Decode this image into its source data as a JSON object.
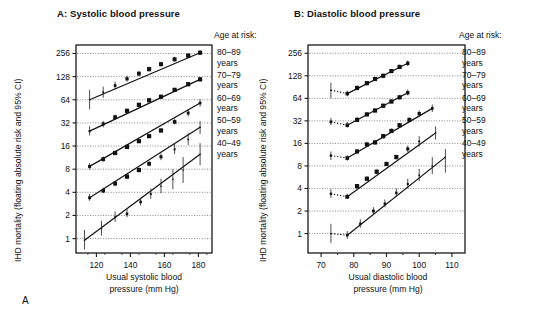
{
  "figure": {
    "letter": "A"
  },
  "panels": [
    {
      "id": "panel-a",
      "title": "A: Systolic blood pressure",
      "age_header": "Age at risk:",
      "ylabel": "IHD mortality (floating absolute risk and 95% CI)",
      "xlabel_line1": "Usual systolic blood",
      "xlabel_line2": "pressure (mm Hg)",
      "age_groups": [
        {
          "range": "80–89",
          "unit": "years"
        },
        {
          "range": "70–79",
          "unit": "years"
        },
        {
          "range": "60–69",
          "unit": "years"
        },
        {
          "range": "50–59",
          "unit": "years"
        },
        {
          "range": "40–49",
          "unit": "years"
        }
      ]
    },
    {
      "id": "panel-b",
      "title": "B: Diastolic blood pressure",
      "age_header": "Age at risk:",
      "ylabel": "IHD mortality (floating absolute risk and 95% CI)",
      "xlabel_line1": "Usual diastolic blood",
      "xlabel_line2": "pressure (mm Hg)",
      "age_groups": [
        {
          "range": "80–89",
          "unit": "years"
        },
        {
          "range": "70–79",
          "unit": "years"
        },
        {
          "range": "60–69",
          "unit": "years"
        },
        {
          "range": "50–59",
          "unit": "years"
        },
        {
          "range": "40–49",
          "unit": "years"
        }
      ]
    }
  ],
  "chart_data": [
    {
      "type": "scatter",
      "panel": "A",
      "title": "A: Systolic blood pressure",
      "xlabel": "Usual systolic blood pressure (mm Hg)",
      "ylabel": "IHD mortality (floating absolute risk and 95% CI)",
      "yscale": "log2",
      "xlim": [
        108,
        188
      ],
      "ylim": [
        0.65,
        330
      ],
      "xticks": [
        120,
        140,
        160,
        180
      ],
      "yticks": [
        1,
        2,
        4,
        8,
        16,
        32,
        64,
        128,
        256
      ],
      "grid": "horizontal-dotted",
      "legend_position": "right",
      "series": [
        {
          "name": "80–89 years",
          "x": [
            116,
            124,
            131,
            138,
            145,
            151,
            158,
            166,
            174,
            181
          ],
          "y": [
            64,
            80,
            98,
            120,
            140,
            160,
            186,
            215,
            240,
            262
          ],
          "ci_low": [
            48,
            68,
            88,
            110,
            130,
            150,
            172,
            200,
            224,
            244
          ],
          "ci_high": [
            86,
            95,
            110,
            132,
            152,
            172,
            200,
            232,
            258,
            282
          ]
        },
        {
          "name": "70–79 years",
          "x": [
            116,
            124,
            131,
            138,
            145,
            151,
            158,
            166,
            174,
            181
          ],
          "y": [
            25,
            31,
            38,
            46,
            55,
            63,
            70,
            86,
            102,
            118
          ],
          "ci_low": [
            22,
            28,
            35,
            43,
            52,
            60,
            66,
            81,
            96,
            110
          ],
          "ci_high": [
            29,
            34,
            41,
            49,
            58,
            67,
            75,
            92,
            109,
            127
          ]
        },
        {
          "name": "60–69 years",
          "x": [
            116,
            124,
            131,
            138,
            145,
            151,
            158,
            166,
            174,
            181
          ],
          "y": [
            8.7,
            10.8,
            13.0,
            15.6,
            18.5,
            21.5,
            25.5,
            33,
            43,
            58
          ],
          "ci_low": [
            7.9,
            10.0,
            12.2,
            14.8,
            17.6,
            20.4,
            24.0,
            30.5,
            39,
            52
          ],
          "ci_high": [
            9.6,
            11.7,
            13.9,
            16.5,
            19.5,
            22.7,
            27.2,
            36,
            48,
            65
          ]
        },
        {
          "name": "50–59 years",
          "x": [
            116,
            124,
            131,
            138,
            145,
            151,
            158,
            166,
            174,
            181
          ],
          "y": [
            3.4,
            4.2,
            5.2,
            6.4,
            7.8,
            9.4,
            11.6,
            14.5,
            19.5,
            28
          ],
          "ci_low": [
            3.1,
            3.9,
            4.8,
            6.0,
            7.3,
            8.7,
            10.5,
            12.6,
            16.5,
            23
          ],
          "ci_high": [
            3.8,
            4.6,
            5.6,
            6.9,
            8.4,
            10.2,
            12.8,
            17.0,
            23.5,
            34
          ]
        },
        {
          "name": "40–49 years",
          "x": [
            113,
            123,
            131,
            138,
            146,
            152,
            158,
            165,
            171,
            181
          ],
          "y": [
            0.95,
            1.35,
            1.9,
            2.1,
            3.0,
            3.8,
            4.8,
            5.9,
            7.8,
            12.5
          ],
          "ci_low": [
            0.72,
            1.1,
            1.65,
            1.9,
            2.7,
            3.3,
            3.9,
            4.4,
            5.3,
            9.0
          ],
          "ci_high": [
            1.3,
            1.7,
            2.25,
            2.4,
            3.4,
            4.5,
            6.0,
            8.0,
            11.5,
            17.5
          ]
        }
      ]
    },
    {
      "type": "scatter",
      "panel": "B",
      "title": "B: Diastolic blood pressure",
      "xlabel": "Usual diastolic blood pressure (mm Hg)",
      "ylabel": "IHD mortality (floating absolute risk and 95% CI)",
      "yscale": "log2",
      "xlim": [
        66,
        114
      ],
      "ylim": [
        0.55,
        330
      ],
      "xticks": [
        70,
        80,
        90,
        100,
        110
      ],
      "yticks": [
        1,
        2,
        4,
        8,
        16,
        32,
        64,
        128,
        256
      ],
      "grid": "horizontal-dotted",
      "legend_position": "right",
      "series": [
        {
          "name": "80–89 years",
          "x": [
            73,
            78,
            81,
            84,
            86.5,
            89,
            91.5,
            94,
            96.5
          ],
          "y": [
            82,
            74,
            88,
            102,
            116,
            128,
            148,
            168,
            188
          ],
          "ci_low": [
            64,
            68,
            82,
            96,
            110,
            122,
            140,
            158,
            172
          ],
          "ci_high": [
            104,
            81,
            95,
            109,
            123,
            136,
            158,
            180,
            206
          ],
          "detached_first": true
        },
        {
          "name": "70–79 years",
          "x": [
            73,
            78,
            81,
            84,
            86.5,
            89,
            91.5,
            94,
            96.5
          ],
          "y": [
            31,
            28,
            33,
            39,
            44,
            51,
            58,
            66,
            76
          ],
          "ci_low": [
            28,
            26,
            31,
            37,
            42,
            48,
            55,
            62,
            70
          ],
          "ci_high": [
            35,
            31,
            36,
            42,
            47,
            54,
            62,
            71,
            84
          ],
          "detached_first": true
        },
        {
          "name": "60–69 years",
          "x": [
            73,
            78,
            81,
            84,
            86.5,
            89,
            91.5,
            94,
            97,
            100,
            104
          ],
          "y": [
            11,
            10.2,
            12.5,
            15.5,
            16.5,
            20,
            23.5,
            28,
            33,
            40,
            47
          ],
          "ci_low": [
            9.6,
            9.4,
            11.6,
            14.4,
            15.4,
            18.6,
            22.0,
            26.0,
            30.5,
            36.5,
            42
          ],
          "ci_high": [
            12.5,
            11.1,
            13.5,
            16.7,
            17.8,
            21.5,
            25.2,
            30.0,
            35.5,
            44,
            53
          ],
          "detached_first": true
        },
        {
          "name": "50–59 years",
          "x": [
            73,
            78,
            81,
            84,
            87,
            90,
            93,
            96.5,
            100,
            105
          ],
          "y": [
            3.4,
            3.1,
            4.3,
            5.4,
            6.7,
            8.5,
            10.5,
            13.5,
            17.0,
            22.0
          ],
          "ci_low": [
            3.0,
            2.9,
            4.0,
            5.1,
            6.3,
            8.0,
            9.8,
            12.3,
            14.5,
            18.0
          ],
          "ci_high": [
            3.9,
            3.4,
            4.6,
            5.8,
            7.2,
            9.1,
            11.3,
            15.0,
            20.0,
            27.0
          ],
          "detached_first": true
        },
        {
          "name": "40–49 years",
          "x": [
            73,
            78,
            82,
            86,
            89.5,
            93,
            96.5,
            100,
            104,
            108
          ],
          "y": [
            1.0,
            0.95,
            1.35,
            2.0,
            2.5,
            3.5,
            4.6,
            6.0,
            8.0,
            10.5
          ],
          "ci_low": [
            0.75,
            0.85,
            1.2,
            1.8,
            2.25,
            3.1,
            4.0,
            5.0,
            6.2,
            6.5
          ],
          "ci_high": [
            1.35,
            1.08,
            1.55,
            2.25,
            2.85,
            4.0,
            5.4,
            7.3,
            10.5,
            13.5
          ],
          "detached_first": true
        }
      ]
    }
  ]
}
